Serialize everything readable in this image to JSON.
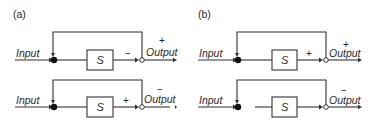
{
  "figure": {
    "panels": [
      {
        "label": "(a)",
        "loops": [
          {
            "input_label": "Input",
            "block_label": "S",
            "forward_sign": "−",
            "output_label": "Output",
            "output_sign": "+"
          },
          {
            "input_label": "Input",
            "block_label": "S",
            "forward_sign": "+",
            "output_label": "Output",
            "output_sign": "−"
          }
        ]
      },
      {
        "label": "(b)",
        "loops": [
          {
            "input_label": "Input",
            "block_label": "S",
            "forward_sign": "+",
            "output_label": "Output",
            "output_sign": "+"
          },
          {
            "input_label": "Input",
            "block_label": "S",
            "forward_sign": "",
            "output_label": "Output",
            "output_sign": "−"
          }
        ]
      }
    ]
  },
  "colors": {
    "line": "#333333",
    "node_filled": "#111111",
    "background": "#ffffff"
  }
}
